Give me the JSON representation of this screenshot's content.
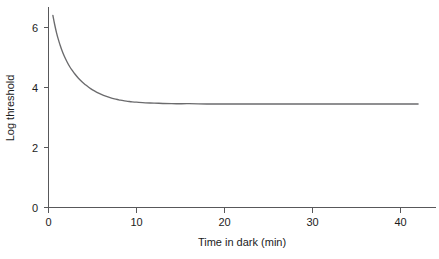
{
  "chart_data": {
    "type": "line",
    "title": "",
    "xlabel": "Time in dark (min)",
    "ylabel": "Log threshold",
    "xlim": [
      0,
      44
    ],
    "ylim": [
      0,
      7.2
    ],
    "xticks": [
      0,
      10,
      20,
      30,
      40
    ],
    "xticklabels": [
      "0",
      "10",
      "20",
      "30",
      "40"
    ],
    "yticks": [
      0,
      2,
      4,
      6
    ],
    "yticklabels": [
      "0",
      "2",
      "4",
      "6"
    ],
    "grid": false,
    "legend": false,
    "series": [
      {
        "name": "Dark adaptation threshold",
        "x": [
          0.5,
          0.7,
          0.9,
          1.1,
          1.3,
          1.5,
          1.8,
          2.1,
          2.4,
          2.7,
          3.0,
          3.4,
          3.8,
          4.2,
          4.6,
          5.0,
          5.5,
          6.0,
          6.5,
          7.0,
          7.5,
          8.0,
          8.5,
          9.0,
          9.5,
          10.0,
          11.0,
          12.0,
          14.0,
          16.0,
          18.0,
          20.0,
          24.0,
          28.0,
          32.0,
          36.0,
          40.0,
          42.0
        ],
        "y": [
          6.4,
          6.1,
          5.84,
          5.62,
          5.43,
          5.26,
          5.04,
          4.86,
          4.7,
          4.57,
          4.45,
          4.31,
          4.19,
          4.09,
          4.0,
          3.92,
          3.84,
          3.77,
          3.71,
          3.66,
          3.62,
          3.59,
          3.56,
          3.54,
          3.52,
          3.51,
          3.49,
          3.48,
          3.46,
          3.46,
          3.45,
          3.45,
          3.45,
          3.45,
          3.45,
          3.45,
          3.45,
          3.45
        ]
      }
    ],
    "asymptote": 3.45,
    "start_value": 6.4,
    "colors": {
      "curve": "#6b6b6d",
      "axis": "#58585a",
      "text": "#1c1c1c",
      "background": "#ffffff"
    }
  }
}
